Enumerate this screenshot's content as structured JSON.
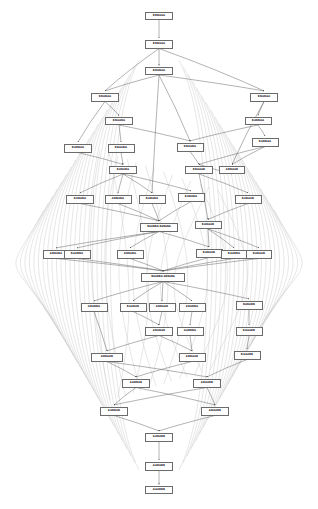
{
  "diagram": {
    "type": "layered-dag",
    "canvas": {
      "width": 318,
      "height": 509,
      "background": "#ffffff"
    },
    "style": {
      "node_fill": "#fdfdfd",
      "node_border": "#6b6b6b",
      "node_text": "#3a3a3a",
      "edge_direct": "#555555",
      "edge_long": "#c9c9c9",
      "arrowhead": "#555555"
    },
    "layers": [
      {
        "index": 0,
        "y": 16,
        "node_count": 1
      },
      {
        "index": 1,
        "y": 44,
        "node_count": 1
      },
      {
        "index": 2,
        "y": 71,
        "node_count": 1
      },
      {
        "index": 3,
        "y": 97,
        "node_count": 2
      },
      {
        "index": 4,
        "y": 121,
        "node_count": 2
      },
      {
        "index": 5,
        "y": 146,
        "node_count": 4
      },
      {
        "index": 6,
        "y": 168,
        "node_count": 4
      },
      {
        "index": 7,
        "y": 197,
        "node_count": 5
      },
      {
        "index": 8,
        "y": 227,
        "node_count": 2
      },
      {
        "index": 9,
        "y": 253,
        "node_count": 5
      },
      {
        "index": 10,
        "y": 277,
        "node_count": 1
      },
      {
        "index": 11,
        "y": 305,
        "node_count": 5
      },
      {
        "index": 12,
        "y": 330,
        "node_count": 3
      },
      {
        "index": 13,
        "y": 356,
        "node_count": 3
      },
      {
        "index": 14,
        "y": 381,
        "node_count": 2
      },
      {
        "index": 15,
        "y": 410,
        "node_count": 2
      },
      {
        "index": 16,
        "y": 437,
        "node_count": 1
      },
      {
        "index": 17,
        "y": 466,
        "node_count": 1
      },
      {
        "index": 18,
        "y": 490,
        "node_count": 1
      }
    ],
    "nodes": [
      {
        "id": "n0",
        "label": "BBBAAA",
        "x": 159,
        "y": 16,
        "w": 28,
        "h": 8,
        "layer": 0
      },
      {
        "id": "n1",
        "label": "BBBAAA",
        "x": 159,
        "y": 44,
        "w": 28,
        "h": 9,
        "layer": 1
      },
      {
        "id": "n2",
        "label": "BBABAA",
        "x": 159,
        "y": 71,
        "w": 28,
        "h": 8,
        "layer": 2
      },
      {
        "id": "n3",
        "label": "BBABAA",
        "x": 105,
        "y": 97,
        "w": 28,
        "h": 9,
        "layer": 3
      },
      {
        "id": "n4",
        "label": "BBABAA",
        "x": 264,
        "y": 97,
        "w": 28,
        "h": 9,
        "layer": 3
      },
      {
        "id": "n5",
        "label": "BBAABA",
        "x": 119,
        "y": 121,
        "w": 28,
        "h": 8,
        "layer": 4
      },
      {
        "id": "n6",
        "label": "BABBAA",
        "x": 258,
        "y": 121,
        "w": 27,
        "h": 8,
        "layer": 4
      },
      {
        "id": "n7",
        "label": "BABBAA",
        "x": 78,
        "y": 148,
        "w": 28,
        "h": 9,
        "layer": 5
      },
      {
        "id": "n8",
        "label": "BBAABA",
        "x": 121,
        "y": 148,
        "w": 27,
        "h": 9,
        "layer": 5
      },
      {
        "id": "n9",
        "label": "BBAABA",
        "x": 190,
        "y": 147,
        "w": 27,
        "h": 9,
        "layer": 5
      },
      {
        "id": "n10",
        "label": "BABBAA",
        "x": 265,
        "y": 142,
        "w": 27,
        "h": 9,
        "layer": 5
      },
      {
        "id": "n11",
        "label": "BABABA",
        "x": 123,
        "y": 170,
        "w": 28,
        "h": 8,
        "layer": 6
      },
      {
        "id": "n12",
        "label": "BBAAAB",
        "x": 199,
        "y": 170,
        "w": 28,
        "h": 8,
        "layer": 6
      },
      {
        "id": "n13",
        "label": "ABBAAB",
        "x": 232,
        "y": 170,
        "w": 26,
        "h": 8,
        "layer": 6
      },
      {
        "id": "n14",
        "label": "BABABA",
        "x": 80,
        "y": 199,
        "w": 28,
        "h": 9,
        "layer": 7
      },
      {
        "id": "n15",
        "label": "ABBABA",
        "x": 118,
        "y": 199,
        "w": 27,
        "h": 9,
        "layer": 7
      },
      {
        "id": "n16",
        "label": "BABABA",
        "x": 152,
        "y": 199,
        "w": 27,
        "h": 9,
        "layer": 7
      },
      {
        "id": "n17",
        "label": "BABABA",
        "x": 191,
        "y": 197,
        "w": 27,
        "h": 9,
        "layer": 7
      },
      {
        "id": "n18",
        "label": "BABAAB",
        "x": 248,
        "y": 199,
        "w": 27,
        "h": 9,
        "layer": 7
      },
      {
        "id": "n19",
        "label": "BAABBA BABABA",
        "x": 159,
        "y": 227,
        "w": 38,
        "h": 9,
        "layer": 8,
        "wide": true
      },
      {
        "id": "n20",
        "label": "BABAAB",
        "x": 208,
        "y": 225,
        "w": 27,
        "h": 8,
        "layer": 8
      },
      {
        "id": "n21",
        "label": "ABBABA",
        "x": 56,
        "y": 254,
        "w": 26,
        "h": 9,
        "layer": 9
      },
      {
        "id": "n22",
        "label": "BAABBA",
        "x": 77,
        "y": 254,
        "w": 27,
        "h": 9,
        "layer": 9
      },
      {
        "id": "n23",
        "label": "ABBABA",
        "x": 130,
        "y": 254,
        "w": 27,
        "h": 9,
        "layer": 9
      },
      {
        "id": "n24",
        "label": "BABAAB",
        "x": 209,
        "y": 253,
        "w": 27,
        "h": 9,
        "layer": 9
      },
      {
        "id": "n25",
        "label": "BAABBA",
        "x": 234,
        "y": 254,
        "w": 26,
        "h": 9,
        "layer": 9
      },
      {
        "id": "n26",
        "label": "BABAAB",
        "x": 259,
        "y": 254,
        "w": 26,
        "h": 9,
        "layer": 9
      },
      {
        "id": "n27",
        "label": "BAABBA ABBABA",
        "x": 163,
        "y": 277,
        "w": 44,
        "h": 9,
        "layer": 10,
        "wide": true
      },
      {
        "id": "n28",
        "label": "ABABBA",
        "x": 94,
        "y": 307,
        "w": 27,
        "h": 9,
        "layer": 11
      },
      {
        "id": "n29",
        "label": "BAABAB",
        "x": 133,
        "y": 307,
        "w": 27,
        "h": 9,
        "layer": 11
      },
      {
        "id": "n30",
        "label": "ABBAAB",
        "x": 162,
        "y": 307,
        "w": 27,
        "h": 9,
        "layer": 11
      },
      {
        "id": "n31",
        "label": "ABABBA",
        "x": 192,
        "y": 307,
        "w": 27,
        "h": 9,
        "layer": 11
      },
      {
        "id": "n32",
        "label": "BABABB",
        "x": 249,
        "y": 305,
        "w": 27,
        "h": 9,
        "layer": 11
      },
      {
        "id": "n33",
        "label": "ABABAB",
        "x": 159,
        "y": 331,
        "w": 28,
        "h": 9,
        "layer": 12
      },
      {
        "id": "n34",
        "label": "AABBBA",
        "x": 190,
        "y": 331,
        "w": 27,
        "h": 9,
        "layer": 12
      },
      {
        "id": "n35",
        "label": "BAAABB",
        "x": 249,
        "y": 331,
        "w": 27,
        "h": 9,
        "layer": 12
      },
      {
        "id": "n36",
        "label": "ABBAAB",
        "x": 107,
        "y": 357,
        "w": 32,
        "h": 9,
        "layer": 13
      },
      {
        "id": "n37",
        "label": "ABBAAB",
        "x": 192,
        "y": 357,
        "w": 27,
        "h": 9,
        "layer": 13
      },
      {
        "id": "n38",
        "label": "BAAABB",
        "x": 247,
        "y": 355,
        "w": 27,
        "h": 9,
        "layer": 13
      },
      {
        "id": "n39",
        "label": "AABBAB",
        "x": 136,
        "y": 383,
        "w": 28,
        "h": 9,
        "layer": 14
      },
      {
        "id": "n40",
        "label": "ABAABB",
        "x": 207,
        "y": 383,
        "w": 28,
        "h": 9,
        "layer": 14
      },
      {
        "id": "n41",
        "label": "AABBAB",
        "x": 114,
        "y": 411,
        "w": 28,
        "h": 9,
        "layer": 15
      },
      {
        "id": "n42",
        "label": "ABAABB",
        "x": 215,
        "y": 411,
        "w": 28,
        "h": 9,
        "layer": 15
      },
      {
        "id": "n43",
        "label": "AABABB",
        "x": 159,
        "y": 437,
        "w": 28,
        "h": 9,
        "layer": 16
      },
      {
        "id": "n44",
        "label": "AABABB",
        "x": 159,
        "y": 466,
        "w": 28,
        "h": 9,
        "layer": 17
      },
      {
        "id": "n45",
        "label": "AAABBB",
        "x": 159,
        "y": 490,
        "w": 28,
        "h": 8,
        "layer": 18
      }
    ],
    "direct_edges": [
      [
        "n0",
        "n1"
      ],
      [
        "n1",
        "n2"
      ],
      [
        "n2",
        "n3"
      ],
      [
        "n2",
        "n4"
      ],
      [
        "n1",
        "n3"
      ],
      [
        "n1",
        "n4"
      ],
      [
        "n3",
        "n5"
      ],
      [
        "n4",
        "n6"
      ],
      [
        "n2",
        "n9"
      ],
      [
        "n2",
        "n16"
      ],
      [
        "n5",
        "n8"
      ],
      [
        "n6",
        "n10"
      ],
      [
        "n3",
        "n7"
      ],
      [
        "n4",
        "n13"
      ],
      [
        "n7",
        "n11"
      ],
      [
        "n8",
        "n11"
      ],
      [
        "n9",
        "n12"
      ],
      [
        "n10",
        "n12"
      ],
      [
        "n5",
        "n9"
      ],
      [
        "n6",
        "n9"
      ],
      [
        "n11",
        "n14"
      ],
      [
        "n11",
        "n15"
      ],
      [
        "n11",
        "n16"
      ],
      [
        "n11",
        "n17"
      ],
      [
        "n12",
        "n18"
      ],
      [
        "n13",
        "n12"
      ],
      [
        "n10",
        "n13"
      ],
      [
        "n14",
        "n19"
      ],
      [
        "n15",
        "n19"
      ],
      [
        "n16",
        "n19"
      ],
      [
        "n17",
        "n19"
      ],
      [
        "n18",
        "n20"
      ],
      [
        "n12",
        "n20"
      ],
      [
        "n19",
        "n21"
      ],
      [
        "n19",
        "n22"
      ],
      [
        "n19",
        "n23"
      ],
      [
        "n19",
        "n24"
      ],
      [
        "n20",
        "n24"
      ],
      [
        "n20",
        "n25"
      ],
      [
        "n20",
        "n26"
      ],
      [
        "n21",
        "n27"
      ],
      [
        "n22",
        "n27"
      ],
      [
        "n23",
        "n27"
      ],
      [
        "n24",
        "n27"
      ],
      [
        "n25",
        "n27"
      ],
      [
        "n26",
        "n27"
      ],
      [
        "n27",
        "n28"
      ],
      [
        "n27",
        "n29"
      ],
      [
        "n27",
        "n30"
      ],
      [
        "n27",
        "n31"
      ],
      [
        "n27",
        "n32"
      ],
      [
        "n29",
        "n33"
      ],
      [
        "n30",
        "n33"
      ],
      [
        "n31",
        "n34"
      ],
      [
        "n32",
        "n35"
      ],
      [
        "n28",
        "n36"
      ],
      [
        "n33",
        "n36"
      ],
      [
        "n34",
        "n37"
      ],
      [
        "n35",
        "n38"
      ],
      [
        "n33",
        "n37"
      ],
      [
        "n36",
        "n39"
      ],
      [
        "n37",
        "n39"
      ],
      [
        "n36",
        "n40"
      ],
      [
        "n38",
        "n40"
      ],
      [
        "n39",
        "n41"
      ],
      [
        "n40",
        "n42"
      ],
      [
        "n39",
        "n42"
      ],
      [
        "n40",
        "n41"
      ],
      [
        "n41",
        "n43"
      ],
      [
        "n42",
        "n43"
      ],
      [
        "n43",
        "n44"
      ],
      [
        "n44",
        "n45"
      ]
    ],
    "long_edge_bundles": {
      "description": "Many long light-gray curved edges bow out to the left and right margins, connecting upper-layer nodes to far lower-layer nodes.",
      "color": "#c9c9c9",
      "left_count": 22,
      "right_count": 22
    }
  }
}
